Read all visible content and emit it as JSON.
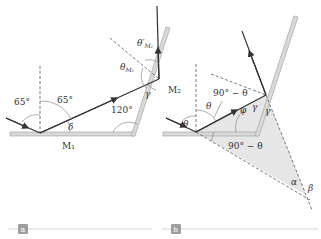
{
  "figure": {
    "panels": [
      {
        "id": "a",
        "tag_label": "a",
        "labels": {
          "angle_incident": "65°",
          "angle_reflected": "65°",
          "angle_mirror_junction": "120°",
          "delta": "δ",
          "gamma": "γ",
          "theta_m2": "θ",
          "theta_m2_sub": "M₂",
          "theta_prime_m2": "θ′",
          "theta_prime_m2_sub": "M₂",
          "mirror1": "M₁",
          "mirror2": "M₂"
        }
      },
      {
        "id": "b",
        "tag_label": "b",
        "labels": {
          "theta_left": "θ",
          "theta_right": "θ",
          "ninety_minus_theta_top": "90° − θ",
          "ninety_minus_theta_bottom": "90° − θ",
          "phi": "φ",
          "gamma1": "γ",
          "gamma2": "γ",
          "alpha": "α",
          "beta": "β"
        }
      }
    ],
    "colors": {
      "ray": "#333333",
      "mirror_fill": "#d9d9d9",
      "mirror_edge": "#9a9a9a",
      "shaded_triangle": "#e6e6e6",
      "tag_bg": "#9e9e9e",
      "tag_line": "#cccccc"
    }
  }
}
